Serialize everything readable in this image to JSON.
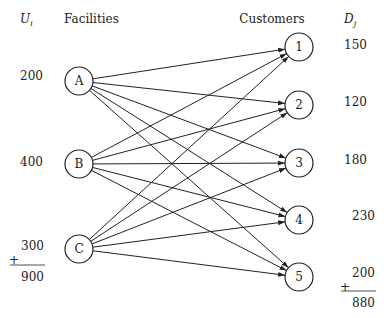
{
  "headers": {
    "supply_symbol": "U",
    "supply_subscript": "i",
    "facilities": "Facilities",
    "customers": "Customers",
    "demand_symbol": "D",
    "demand_subscript": "j"
  },
  "facilities": [
    {
      "id": "A",
      "supply": "200"
    },
    {
      "id": "B",
      "supply": "400"
    },
    {
      "id": "C",
      "supply": "300"
    }
  ],
  "customers": [
    {
      "id": "1",
      "demand": "150"
    },
    {
      "id": "2",
      "demand": "120"
    },
    {
      "id": "3",
      "demand": "180"
    },
    {
      "id": "4",
      "demand": "230"
    },
    {
      "id": "5",
      "demand": "200"
    }
  ],
  "supply_total": {
    "plus": "+",
    "value": "900"
  },
  "demand_total": {
    "plus": "+",
    "value": "880"
  },
  "edges": [
    [
      "A",
      "1"
    ],
    [
      "A",
      "2"
    ],
    [
      "A",
      "3"
    ],
    [
      "A",
      "4"
    ],
    [
      "A",
      "5"
    ],
    [
      "B",
      "1"
    ],
    [
      "B",
      "2"
    ],
    [
      "B",
      "3"
    ],
    [
      "B",
      "4"
    ],
    [
      "B",
      "5"
    ],
    [
      "C",
      "1"
    ],
    [
      "C",
      "2"
    ],
    [
      "C",
      "3"
    ],
    [
      "C",
      "4"
    ],
    [
      "C",
      "5"
    ]
  ]
}
